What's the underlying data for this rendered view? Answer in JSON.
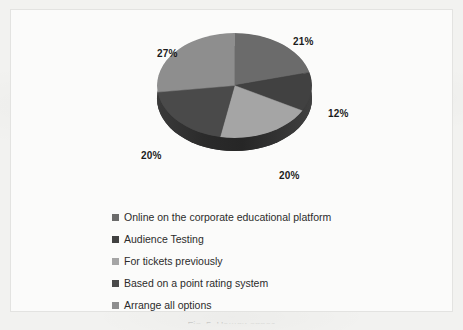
{
  "chart_data": {
    "type": "pie",
    "title": "",
    "subtitle": "",
    "xlabel": "",
    "ylabel": "",
    "three_d": true,
    "grid": false,
    "legend_position": "bottom",
    "value_suffix": "%",
    "categories": [
      "Online on the corporate educational platform",
      "Audience Testing",
      "For tickets previously",
      "Based on a point rating system",
      "Arrange all options"
    ],
    "values": [
      21,
      12,
      20,
      20,
      27
    ],
    "labels": [
      "21%",
      "12%",
      "20%",
      "20%",
      "27%"
    ],
    "colors": [
      "#6b6b6b",
      "#414141",
      "#a5a5a5",
      "#4a4a4a",
      "#8e8e8e"
    ],
    "slices": [
      {
        "label": "21%",
        "value": 21,
        "category": "Online on the corporate educational platform",
        "color": "#6b6b6b"
      },
      {
        "label": "12%",
        "value": 12,
        "category": "Audience Testing",
        "color": "#414141"
      },
      {
        "label": "20%",
        "value": 20,
        "category": "For tickets previously",
        "color": "#a5a5a5"
      },
      {
        "label": "20%",
        "value": 20,
        "category": "Based on a point rating system",
        "color": "#4a4a4a"
      },
      {
        "label": "27%",
        "value": 27,
        "category": "Arrange all options",
        "color": "#8e8e8e"
      }
    ]
  },
  "legend": {
    "items": [
      {
        "label": "Online on the corporate educational platform",
        "color": "#6b6b6b"
      },
      {
        "label": "Audience Testing",
        "color": "#414141"
      },
      {
        "label": "For tickets previously",
        "color": "#a5a5a5"
      },
      {
        "label": "Based on a point rating system",
        "color": "#4a4a4a"
      },
      {
        "label": "Arrange all options",
        "color": "#8e8e8e"
      }
    ]
  },
  "caption": {
    "text": "Fig. 5. Нашли опрос"
  },
  "theme": {
    "page_background": "#f2f2f0",
    "frame_background": "#fbfbfa",
    "frame_border": "#e3e3e1",
    "label_color": "#1c1c1c",
    "legend_text_color": "#2b2b2b",
    "pie_side_color": "#2e2e2e"
  }
}
